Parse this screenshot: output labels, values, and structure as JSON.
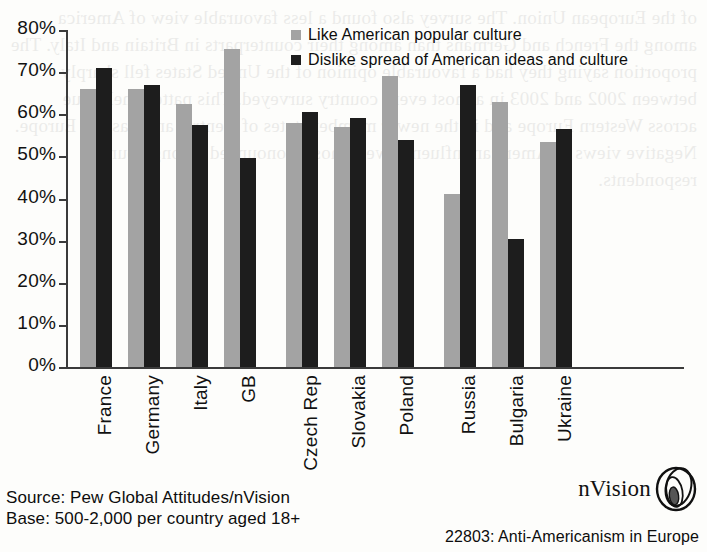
{
  "chart_data": {
    "type": "bar",
    "title": "",
    "xlabel": "",
    "ylabel": "",
    "ylim": [
      0,
      80
    ],
    "grid": false,
    "legend_position": "top-center",
    "ytick_labels": [
      "80%",
      "70%",
      "60%",
      "50%",
      "40%",
      "30%",
      "20%",
      "10%",
      "0%"
    ],
    "ytick_values": [
      80,
      70,
      60,
      50,
      40,
      30,
      20,
      10,
      0
    ],
    "categories": [
      "France",
      "Germany",
      "Italy",
      "GB",
      "Czech Rep",
      "Slovakia",
      "Poland",
      "Russia",
      "Bulgaria",
      "Ukraine"
    ],
    "group_breaks": [
      4,
      7
    ],
    "series": [
      {
        "name": "Like American popular culture",
        "color": "#a3a3a3",
        "values": [
          66,
          66,
          62.5,
          75.5,
          58,
          57,
          69,
          41,
          63,
          53.5
        ]
      },
      {
        "name": "Dislike spread of American ideas and culture",
        "color": "#1d1d1d",
        "values": [
          71,
          67,
          57.5,
          49.5,
          60.5,
          59,
          54,
          67,
          30.5,
          56.5
        ]
      }
    ]
  },
  "legend": {
    "items": [
      {
        "label": "Like American popular culture",
        "swatch": "light"
      },
      {
        "label": "Dislike spread of American ideas and culture",
        "swatch": "dark"
      }
    ]
  },
  "footer": {
    "source_line": "Source: Pew Global Attitudes/nVision",
    "base_line": "Base: 500-2,000 per country aged 18+",
    "brand_name": "nVision",
    "reference": "22803: Anti-Americanism in Europe"
  },
  "ghost_text": "of the European Union. The survey also found a less favourable view of America among the French and Germans than among their counterparts in Britain and Italy. The proportion saying they had a favourable opinion of the United States fell sharply between 2002 and 2003 in almost every country surveyed. This pattern held true across Western Europe and in the newer member states of Central and Eastern Europe. Negative views of American influence were most pronounced among younger respondents."
}
